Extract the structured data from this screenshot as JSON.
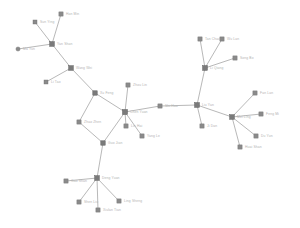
{
  "figure": {
    "title": "",
    "background_color": "#ffffff",
    "node_color": "#8a8a8a",
    "hub_color": "#7a7a7a",
    "edge_color": "#9a9a9a",
    "label_color": "#b2b2b2"
  },
  "chart_data": {
    "type": "diagram",
    "subtype": "node-link-network-graph",
    "title": "",
    "xlabel": "",
    "ylabel": "",
    "grid": false,
    "legend": null,
    "axis_visible": false,
    "xlim": [
      0,
      300
    ],
    "ylim": [
      0,
      228
    ],
    "node_shape_default": "square",
    "nodes": [
      {
        "id": "n01",
        "label": "Ma Yun",
        "x": 18,
        "y": 49,
        "shape": "circle",
        "size": 4.2,
        "anchor": "start",
        "lx": 23,
        "ly": 50.2
      },
      {
        "id": "n02",
        "label": "Sun Ying",
        "x": 35,
        "y": 22,
        "shape": "square",
        "size": 4.0,
        "anchor": "start",
        "lx": 40,
        "ly": 23.2
      },
      {
        "id": "n03",
        "label": "Han Min",
        "x": 61,
        "y": 14,
        "shape": "square",
        "size": 4.2,
        "anchor": "start",
        "lx": 66,
        "ly": 15.2
      },
      {
        "id": "n04",
        "label": "Yan Shan",
        "x": 52,
        "y": 44,
        "shape": "hub",
        "size": 4.6,
        "anchor": "start",
        "lx": 57,
        "ly": 45.2
      },
      {
        "id": "n05",
        "label": "Wang Wei",
        "x": 71,
        "y": 68,
        "shape": "hub",
        "size": 4.6,
        "anchor": "start",
        "lx": 76,
        "ly": 69.2
      },
      {
        "id": "n06",
        "label": "Li Tao",
        "x": 46,
        "y": 82,
        "shape": "square",
        "size": 4.0,
        "anchor": "start",
        "lx": 51,
        "ly": 83.2
      },
      {
        "id": "n07",
        "label": "Xu Feng",
        "x": 95,
        "y": 93,
        "shape": "hub",
        "size": 4.4,
        "anchor": "start",
        "lx": 100,
        "ly": 94.2
      },
      {
        "id": "n08",
        "label": "Zhao Zhen",
        "x": 79,
        "y": 122,
        "shape": "square",
        "size": 4.2,
        "anchor": "start",
        "lx": 84,
        "ly": 123.2
      },
      {
        "id": "n09",
        "label": "Guo Jian",
        "x": 103,
        "y": 143,
        "shape": "hub",
        "size": 4.4,
        "anchor": "start",
        "lx": 108,
        "ly": 144.2
      },
      {
        "id": "n10",
        "label": "Chen Yuan",
        "x": 125,
        "y": 112,
        "shape": "hub",
        "size": 5.0,
        "anchor": "start",
        "lx": 130,
        "ly": 113.2
      },
      {
        "id": "n11",
        "label": "Zhou Lin",
        "x": 128,
        "y": 85,
        "shape": "square",
        "size": 4.2,
        "anchor": "start",
        "lx": 133,
        "ly": 86.2
      },
      {
        "id": "n12",
        "label": "Lin Hai",
        "x": 126,
        "y": 126,
        "shape": "square",
        "size": 4.2,
        "anchor": "start",
        "lx": 131,
        "ly": 127.2
      },
      {
        "id": "n13",
        "label": "Yang Le",
        "x": 142,
        "y": 136,
        "shape": "square",
        "size": 4.2,
        "anchor": "start",
        "lx": 147,
        "ly": 137.2
      },
      {
        "id": "n14",
        "label": "Shi Hua",
        "x": 160,
        "y": 106,
        "shape": "square",
        "size": 4.2,
        "anchor": "start",
        "lx": 165,
        "ly": 107.2
      },
      {
        "id": "n15",
        "label": "Liu Yan",
        "x": 197,
        "y": 105,
        "shape": "hub",
        "size": 4.8,
        "anchor": "start",
        "lx": 202,
        "ly": 106.2
      },
      {
        "id": "n16",
        "label": "Li Qiang",
        "x": 205,
        "y": 68,
        "shape": "hub",
        "size": 4.8,
        "anchor": "start",
        "lx": 210,
        "ly": 69.2
      },
      {
        "id": "n17",
        "label": "Tan Chao",
        "x": 200,
        "y": 39,
        "shape": "square",
        "size": 4.2,
        "anchor": "start",
        "lx": 205,
        "ly": 40.2
      },
      {
        "id": "n18",
        "label": "Wu Lan",
        "x": 222,
        "y": 39,
        "shape": "square",
        "size": 4.2,
        "anchor": "start",
        "lx": 227,
        "ly": 40.2
      },
      {
        "id": "n19",
        "label": "Song Bo",
        "x": 235,
        "y": 58,
        "shape": "square",
        "size": 4.2,
        "anchor": "start",
        "lx": 240,
        "ly": 59.2
      },
      {
        "id": "n20",
        "label": "Ji Dan",
        "x": 202,
        "y": 126,
        "shape": "square",
        "size": 4.2,
        "anchor": "start",
        "lx": 207,
        "ly": 127.2
      },
      {
        "id": "n21",
        "label": "Mei Ling",
        "x": 232,
        "y": 117,
        "shape": "hub",
        "size": 4.6,
        "anchor": "start",
        "lx": 237,
        "ly": 118.2
      },
      {
        "id": "n22",
        "label": "Fan Lan",
        "x": 255,
        "y": 93,
        "shape": "square",
        "size": 4.2,
        "anchor": "start",
        "lx": 260,
        "ly": 94.2
      },
      {
        "id": "n23",
        "label": "Feng Mi",
        "x": 261,
        "y": 114,
        "shape": "square",
        "size": 4.2,
        "anchor": "start",
        "lx": 266,
        "ly": 115.2
      },
      {
        "id": "n24",
        "label": "Du Yun",
        "x": 256,
        "y": 136,
        "shape": "square",
        "size": 4.2,
        "anchor": "start",
        "lx": 261,
        "ly": 137.2
      },
      {
        "id": "n25",
        "label": "Huai Shan",
        "x": 240,
        "y": 147,
        "shape": "square",
        "size": 4.2,
        "anchor": "start",
        "lx": 245,
        "ly": 148.2
      },
      {
        "id": "n26",
        "label": "Deng Yuan",
        "x": 97,
        "y": 178,
        "shape": "hub",
        "size": 4.6,
        "anchor": "start",
        "lx": 102,
        "ly": 179.2
      },
      {
        "id": "n27",
        "label": "Gao Shan",
        "x": 66,
        "y": 181,
        "shape": "square",
        "size": 4.2,
        "anchor": "start",
        "lx": 71,
        "ly": 182.2
      },
      {
        "id": "n28",
        "label": "Shen Liu",
        "x": 79,
        "y": 202,
        "shape": "square",
        "size": 4.2,
        "anchor": "start",
        "lx": 84,
        "ly": 203.2
      },
      {
        "id": "n29",
        "label": "Xiulan Tian",
        "x": 98,
        "y": 210,
        "shape": "square",
        "size": 4.2,
        "anchor": "start",
        "lx": 103,
        "ly": 211.2
      },
      {
        "id": "n30",
        "label": "Ling Sheng",
        "x": 119,
        "y": 201,
        "shape": "square",
        "size": 4.2,
        "anchor": "start",
        "lx": 124,
        "ly": 202.2
      }
    ],
    "edges": [
      {
        "source": "n01",
        "target": "n04"
      },
      {
        "source": "n02",
        "target": "n04"
      },
      {
        "source": "n03",
        "target": "n04"
      },
      {
        "source": "n04",
        "target": "n05"
      },
      {
        "source": "n05",
        "target": "n06"
      },
      {
        "source": "n05",
        "target": "n07"
      },
      {
        "source": "n07",
        "target": "n08"
      },
      {
        "source": "n07",
        "target": "n10"
      },
      {
        "source": "n08",
        "target": "n09"
      },
      {
        "source": "n09",
        "target": "n10"
      },
      {
        "source": "n10",
        "target": "n11"
      },
      {
        "source": "n10",
        "target": "n12"
      },
      {
        "source": "n10",
        "target": "n13"
      },
      {
        "source": "n10",
        "target": "n14"
      },
      {
        "source": "n14",
        "target": "n15"
      },
      {
        "source": "n09",
        "target": "n26"
      },
      {
        "source": "n15",
        "target": "n16"
      },
      {
        "source": "n16",
        "target": "n17"
      },
      {
        "source": "n16",
        "target": "n18"
      },
      {
        "source": "n16",
        "target": "n19"
      },
      {
        "source": "n15",
        "target": "n20"
      },
      {
        "source": "n15",
        "target": "n21"
      },
      {
        "source": "n21",
        "target": "n22"
      },
      {
        "source": "n21",
        "target": "n23"
      },
      {
        "source": "n21",
        "target": "n24"
      },
      {
        "source": "n21",
        "target": "n25"
      },
      {
        "source": "n26",
        "target": "n27"
      },
      {
        "source": "n26",
        "target": "n28"
      },
      {
        "source": "n26",
        "target": "n29"
      },
      {
        "source": "n26",
        "target": "n30"
      }
    ]
  }
}
